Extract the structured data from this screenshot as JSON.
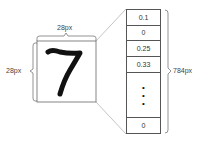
{
  "labels": {
    "width": "28px",
    "height": "28px",
    "vector_length": "784px"
  },
  "image": {
    "digit": "7"
  },
  "vector": {
    "cells": [
      "0.1",
      "0",
      "0.25",
      "0.33"
    ],
    "ellipsis": "•\n•\n•",
    "last": "0"
  },
  "colors": {
    "line": "#555555",
    "text": "#444444",
    "digit": "#111111"
  }
}
